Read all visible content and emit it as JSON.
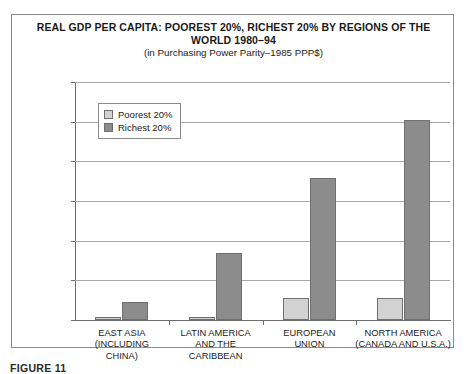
{
  "chart_data": {
    "type": "bar",
    "title": "REAL GDP PER CAPITA: POOREST 20%, RICHEST 20% BY REGIONS OF THE WORLD 1980–94",
    "title_lines": [
      "REAL GDP PER CAPITA: POOREST 20%, RICHEST 20% BY REGIONS OF THE",
      "WORLD 1980–94"
    ],
    "subtitle": "(in Purchasing Power Parity–1985 PPP$)",
    "xlabel": "",
    "ylabel": "",
    "ylim": [
      0,
      60000
    ],
    "yticks": [
      0,
      10000,
      20000,
      30000,
      40000,
      50000,
      60000
    ],
    "ytick_labels": [
      "0",
      "10000",
      "20000",
      "30000",
      "40000",
      "50000",
      "60000"
    ],
    "grid": true,
    "legend_position": "upper left",
    "categories": [
      "EAST ASIA (INCLUDING CHINA)",
      "LATIN AMERICA AND THE CARIBBEAN",
      "EUROPEAN UNION",
      "NORTH AMERICA (CANADA AND U.S.A.)"
    ],
    "category_label_lines": [
      [
        "EAST ASIA",
        "(INCLUDING",
        "CHINA)"
      ],
      [
        "LATIN AMERICA",
        "AND THE",
        "CARIBBEAN"
      ],
      [
        "EUROPEAN",
        "UNION"
      ],
      [
        "NORTH AMERICA",
        "(CANADA AND U.S.A.)"
      ]
    ],
    "series": [
      {
        "name": "Poorest 20%",
        "color": "#d2d2d2",
        "values": [
          700,
          800,
          5500,
          5600
        ]
      },
      {
        "name": "Richest 20%",
        "color": "#8c8c8c",
        "values": [
          4600,
          17000,
          35800,
          50400
        ]
      }
    ]
  },
  "legend": {
    "items": [
      {
        "label": "Poorest 20%",
        "swatch": "poorest"
      },
      {
        "label": "Richest 20%",
        "swatch": "richest"
      }
    ]
  },
  "caption": {
    "text": "FIGURE 11"
  },
  "colors": {
    "poorest": "#d2d2d2",
    "richest": "#8c8c8c",
    "frame": "#8a8a8a",
    "gridline": "#a9a9a9",
    "axis": "#6e6e6e"
  }
}
